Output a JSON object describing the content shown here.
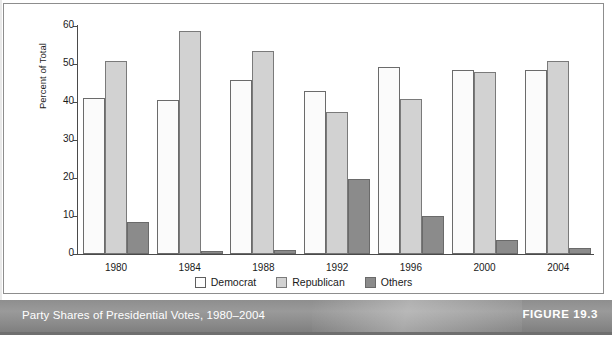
{
  "figure": {
    "caption": "Party Shares of Presidential Votes, 1980–2004",
    "number_label": "FIGURE 19.3"
  },
  "chart_data": {
    "type": "bar",
    "title": "",
    "xlabel": "",
    "ylabel": "Percent of Total",
    "ylim": [
      0,
      60
    ],
    "yticks": [
      0,
      10,
      20,
      30,
      40,
      50,
      60
    ],
    "ytick_labels": [
      "0",
      "10",
      "20",
      "30",
      "40",
      "50",
      "60"
    ],
    "grid": false,
    "legend_position": "bottom-center",
    "categories": [
      "1980",
      "1984",
      "1988",
      "1992",
      "1996",
      "2000",
      "2004"
    ],
    "series": [
      {
        "name": "Democrat",
        "color": "#fbfbfb",
        "values": [
          41.0,
          40.6,
          45.7,
          43.0,
          49.2,
          48.4,
          48.3
        ]
      },
      {
        "name": "Republican",
        "color": "#d2d2d2",
        "values": [
          50.8,
          58.8,
          53.4,
          37.5,
          40.7,
          47.9,
          50.7
        ]
      },
      {
        "name": "Others",
        "color": "#8b8b8b",
        "values": [
          8.4,
          0.7,
          1.1,
          19.7,
          10.0,
          3.8,
          1.7
        ]
      }
    ]
  },
  "legend": {
    "items": [
      {
        "label": "Democrat",
        "key": "democrat"
      },
      {
        "label": "Republican",
        "key": "republican"
      },
      {
        "label": "Others",
        "key": "others"
      }
    ]
  }
}
